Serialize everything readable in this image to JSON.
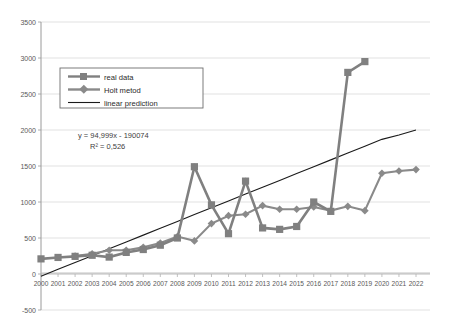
{
  "page": {
    "top_partial_text": "",
    "background": "#ffffff"
  },
  "chart_data": {
    "type": "line",
    "title": "",
    "xlabel": "",
    "ylabel": "",
    "ylim": [
      -500,
      3500
    ],
    "ytick_step": 500,
    "grid": true,
    "legend_position": "upper-left-inside",
    "categories": [
      2000,
      2001,
      2002,
      2003,
      2004,
      2005,
      2006,
      2007,
      2008,
      2009,
      2010,
      2011,
      2012,
      2013,
      2014,
      2015,
      2016,
      2017,
      2018,
      2019,
      2020,
      2021,
      2022
    ],
    "x_tick_labels": [
      "2000",
      "2001",
      "2002",
      "2003",
      "2004",
      "2005",
      "2006",
      "2007",
      "2008",
      "2009",
      "2010",
      "2011",
      "2012",
      "2013",
      "2014",
      "2015",
      "2016",
      "2017",
      "2018",
      "2019",
      "2020",
      "2021",
      "2022"
    ],
    "y_tick_labels": [
      "3500",
      "3000",
      "2500",
      "2000",
      "1500",
      "1000",
      "500",
      "0",
      "-500"
    ],
    "y_tick_values": [
      3500,
      3000,
      2500,
      2000,
      1500,
      1000,
      500,
      0,
      -500
    ],
    "series": [
      {
        "name": "real data",
        "marker": "square",
        "color": "#808080",
        "values": [
          210,
          230,
          245,
          260,
          235,
          300,
          340,
          400,
          500,
          1490,
          960,
          560,
          1290,
          640,
          620,
          660,
          1000,
          870,
          2800,
          2950,
          null,
          null,
          null
        ]
      },
      {
        "name": "Holt metod",
        "marker": "diamond",
        "color": "#8a8a8a",
        "values": [
          null,
          null,
          250,
          280,
          330,
          330,
          370,
          430,
          520,
          460,
          700,
          810,
          830,
          950,
          900,
          900,
          930,
          880,
          940,
          880,
          1400,
          1430,
          1450
        ]
      },
      {
        "name": "linear prediction",
        "marker": "none",
        "color": "#1a1a1a",
        "values": [
          -30,
          65,
          160,
          255,
          350,
          445,
          540,
          635,
          730,
          825,
          920,
          1015,
          1110,
          1205,
          1300,
          1395,
          1490,
          1585,
          1680,
          1775,
          1870,
          1930,
          2000
        ]
      }
    ],
    "annotations": [
      {
        "text": "y = 94,999x - 190074"
      },
      {
        "text": "R² = 0,526"
      }
    ]
  },
  "legend": {
    "items": [
      {
        "label": "real data"
      },
      {
        "label": "Holt metod"
      },
      {
        "label": "linear prediction"
      }
    ]
  },
  "colors": {
    "series_gray": "#808080",
    "trend_black": "#1a1a1a",
    "grid": "#d9d9d9",
    "axis": "#9a9a9a",
    "text": "#595959"
  }
}
